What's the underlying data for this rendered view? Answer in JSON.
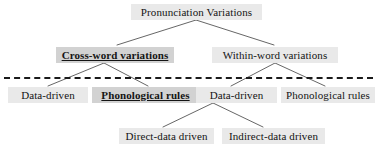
{
  "diagram": {
    "colors": {
      "node_background": "#e9e9e9",
      "emphasis_background": "#d2d2d2",
      "text": "#141414",
      "edge": "#555555",
      "separator": "#1a1a1a",
      "page_background": "#ffffff"
    },
    "separator": {
      "style": "dashed",
      "orientation": "horizontal"
    },
    "nodes": {
      "root": {
        "label": "Pronunciation Variations",
        "emphasis": false
      },
      "cross_word": {
        "label": "Cross-word variations",
        "emphasis": true
      },
      "within_word": {
        "label": "Within-word variations",
        "emphasis": false
      },
      "cw_data_driven": {
        "label": "Data-driven",
        "emphasis": false
      },
      "cw_phonological": {
        "label": "Phonological rules",
        "emphasis": true
      },
      "ww_data_driven": {
        "label": "Data-driven",
        "emphasis": false
      },
      "ww_phonological": {
        "label": "Phonological rules",
        "emphasis": false
      },
      "direct_data": {
        "label": "Direct-data driven",
        "emphasis": false
      },
      "indirect_data": {
        "label": "Indirect-data driven",
        "emphasis": false
      }
    }
  }
}
